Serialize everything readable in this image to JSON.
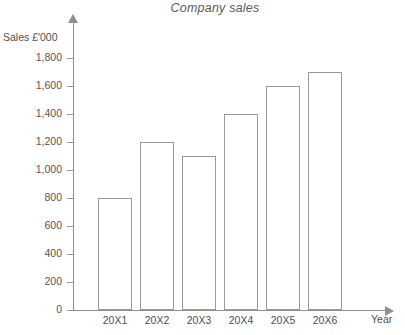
{
  "chart_data": {
    "type": "bar",
    "title": "Company sales",
    "xlabel": "Year",
    "ylabel": "Sales £'000",
    "categories": [
      "20X1",
      "20X2",
      "20X3",
      "20X4",
      "20X5",
      "20X6"
    ],
    "values": [
      800,
      1200,
      1100,
      1400,
      1600,
      1700
    ],
    "ylim": [
      0,
      1800
    ],
    "ytick_step": 200,
    "ytick_labels": [
      "0",
      "200",
      "400",
      "600",
      "800",
      "1,000",
      "1,200",
      "1,400",
      "1,600",
      "1,800"
    ],
    "ytick_values": [
      0,
      200,
      400,
      600,
      800,
      1000,
      1200,
      1400,
      1600,
      1800
    ],
    "grid": false,
    "legend": false,
    "legend_position": "none",
    "series": [
      {
        "name": "Sales",
        "values": [
          800,
          1200,
          1100,
          1400,
          1600,
          1700
        ]
      }
    ],
    "colors": {
      "bar_fill": "#ffffff",
      "bar_border": "#9b9b9b",
      "axis": "#8f8f8f",
      "text": "#4f4f4f",
      "title_text": "#5b5b5b",
      "background": "#ffffff"
    }
  }
}
